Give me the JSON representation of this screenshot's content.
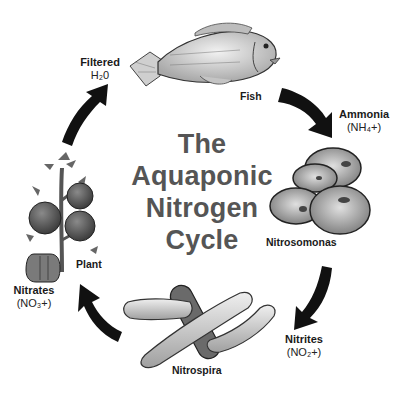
{
  "title": {
    "lines": [
      "The",
      "Aquaponic",
      "Nitrogen",
      "Cycle"
    ],
    "color": "#555555"
  },
  "stages": {
    "filtered": {
      "name": "Filtered",
      "formula": "H₂0"
    },
    "ammonia": {
      "name": "Ammonia",
      "formula": "(NH₄+)"
    },
    "nitrites": {
      "name": "Nitrites",
      "formula": "(NO₂+)"
    },
    "nitrates": {
      "name": "Nitrates",
      "formula": "(NO₃+)"
    }
  },
  "organisms": {
    "fish": "Fish",
    "nitrosomonas": "Nitrosomonas",
    "nitrospira": "Nitrospira",
    "plant": "Plant"
  },
  "arrows": [
    {
      "from": "Fish",
      "to": "Ammonia",
      "icon": "curved-arrow-icon"
    },
    {
      "from": "Nitrosomonas",
      "to": "Nitrites",
      "icon": "curved-arrow-icon"
    },
    {
      "from": "Nitrospira",
      "to": "Nitrates",
      "icon": "curved-arrow-icon"
    },
    {
      "from": "Plant",
      "to": "Filtered H2O",
      "icon": "curved-arrow-icon"
    }
  ],
  "colors": {
    "arrow": "#111111",
    "illustration_fill": "#d8d8d8",
    "illustration_stroke": "#333333",
    "dark_fill": "#666666"
  }
}
